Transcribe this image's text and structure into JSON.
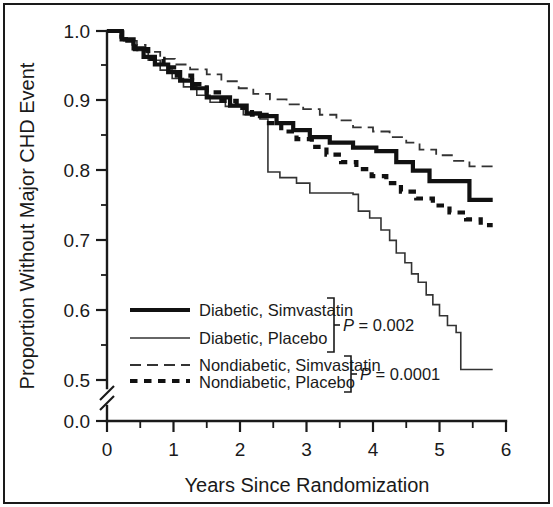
{
  "figure": {
    "background_color": "#ffffff",
    "border_color": "#1a1a1a",
    "ink_color": "#1a1a1a"
  },
  "chart_data": {
    "type": "line",
    "title": "",
    "subtitle": "",
    "xlabel": "Years Since Randomization",
    "ylabel": "Proportion Without Major CHD Event",
    "xlim": [
      0,
      6.2
    ],
    "ylim": [
      0.0,
      1.0
    ],
    "y_axis_break": {
      "present": true,
      "between": [
        0.0,
        0.5
      ],
      "symbol": "double-slash"
    },
    "grid": false,
    "legend_position": "lower-left-inside",
    "x_ticks": [
      0,
      1,
      2,
      3,
      4,
      5,
      6
    ],
    "x_tick_labels": [
      "0",
      "1",
      "2",
      "3",
      "4",
      "5",
      "6"
    ],
    "x_minor_tick_interval": 0.5,
    "y_ticks": [
      0.0,
      0.5,
      0.6,
      0.7,
      0.8,
      0.9,
      1.0
    ],
    "y_tick_labels": [
      "0.0",
      "0.5",
      "0.6",
      "0.7",
      "0.8",
      "0.9",
      "1.0"
    ],
    "y_minor_ticks": [
      0.55,
      0.65,
      0.75,
      0.85,
      0.95
    ],
    "annotations": [
      {
        "text": "P = 0.002",
        "italic_prefix": "P",
        "rest": " = 0.002",
        "groups": [
          "Diabetic, Simvastatin",
          "Diabetic, Placebo"
        ]
      },
      {
        "text": "P = 0.0001",
        "italic_prefix": "P",
        "rest": " = 0.0001",
        "groups": [
          "Nondiabetic, Simvastatin",
          "Nondiabetic, Placebo"
        ]
      }
    ],
    "series": [
      {
        "name": "Diabetic, Simvastatin",
        "style": "thick-solid",
        "color": "#111111",
        "points": [
          [
            0.0,
            1.0
          ],
          [
            0.22,
            1.0
          ],
          [
            0.22,
            0.988
          ],
          [
            0.4,
            0.988
          ],
          [
            0.4,
            0.975
          ],
          [
            0.55,
            0.975
          ],
          [
            0.55,
            0.963
          ],
          [
            0.72,
            0.963
          ],
          [
            0.72,
            0.952
          ],
          [
            0.92,
            0.952
          ],
          [
            0.92,
            0.941
          ],
          [
            1.1,
            0.941
          ],
          [
            1.1,
            0.929
          ],
          [
            1.28,
            0.929
          ],
          [
            1.28,
            0.918
          ],
          [
            1.5,
            0.918
          ],
          [
            1.5,
            0.905
          ],
          [
            1.85,
            0.905
          ],
          [
            1.85,
            0.893
          ],
          [
            2.1,
            0.893
          ],
          [
            2.1,
            0.882
          ],
          [
            2.3,
            0.882
          ],
          [
            2.3,
            0.878
          ],
          [
            2.55,
            0.878
          ],
          [
            2.55,
            0.868
          ],
          [
            2.8,
            0.868
          ],
          [
            2.8,
            0.858
          ],
          [
            3.05,
            0.858
          ],
          [
            3.05,
            0.848
          ],
          [
            3.35,
            0.848
          ],
          [
            3.35,
            0.84
          ],
          [
            3.7,
            0.84
          ],
          [
            3.7,
            0.833
          ],
          [
            4.05,
            0.833
          ],
          [
            4.05,
            0.828
          ],
          [
            4.35,
            0.828
          ],
          [
            4.35,
            0.812
          ],
          [
            4.6,
            0.812
          ],
          [
            4.6,
            0.8
          ],
          [
            4.85,
            0.8
          ],
          [
            4.85,
            0.785
          ],
          [
            5.45,
            0.785
          ],
          [
            5.45,
            0.758
          ],
          [
            5.8,
            0.758
          ]
        ]
      },
      {
        "name": "Diabetic, Placebo",
        "style": "thin-solid",
        "color": "#333333",
        "points": [
          [
            0.0,
            1.0
          ],
          [
            0.25,
            1.0
          ],
          [
            0.25,
            0.986
          ],
          [
            0.45,
            0.986
          ],
          [
            0.45,
            0.972
          ],
          [
            0.62,
            0.972
          ],
          [
            0.62,
            0.958
          ],
          [
            0.8,
            0.958
          ],
          [
            0.8,
            0.944
          ],
          [
            0.98,
            0.944
          ],
          [
            0.98,
            0.932
          ],
          [
            1.15,
            0.932
          ],
          [
            1.15,
            0.92
          ],
          [
            1.35,
            0.92
          ],
          [
            1.35,
            0.908
          ],
          [
            1.55,
            0.908
          ],
          [
            1.55,
            0.898
          ],
          [
            1.78,
            0.898
          ],
          [
            1.78,
            0.892
          ],
          [
            2.05,
            0.892
          ],
          [
            2.05,
            0.88
          ],
          [
            2.3,
            0.88
          ],
          [
            2.3,
            0.874
          ],
          [
            2.42,
            0.874
          ],
          [
            2.42,
            0.798
          ],
          [
            2.6,
            0.798
          ],
          [
            2.6,
            0.79
          ],
          [
            2.85,
            0.79
          ],
          [
            2.85,
            0.782
          ],
          [
            3.05,
            0.782
          ],
          [
            3.05,
            0.768
          ],
          [
            3.7,
            0.768
          ],
          [
            3.7,
            0.766
          ],
          [
            3.78,
            0.766
          ],
          [
            3.78,
            0.742
          ],
          [
            3.95,
            0.742
          ],
          [
            3.95,
            0.732
          ],
          [
            4.12,
            0.732
          ],
          [
            4.12,
            0.715
          ],
          [
            4.25,
            0.715
          ],
          [
            4.25,
            0.7
          ],
          [
            4.35,
            0.7
          ],
          [
            4.35,
            0.682
          ],
          [
            4.48,
            0.682
          ],
          [
            4.48,
            0.668
          ],
          [
            4.58,
            0.668
          ],
          [
            4.58,
            0.652
          ],
          [
            4.68,
            0.652
          ],
          [
            4.68,
            0.64
          ],
          [
            4.8,
            0.64
          ],
          [
            4.8,
            0.622
          ],
          [
            4.9,
            0.622
          ],
          [
            4.9,
            0.608
          ],
          [
            5.0,
            0.608
          ],
          [
            5.0,
            0.592
          ],
          [
            5.12,
            0.592
          ],
          [
            5.12,
            0.578
          ],
          [
            5.25,
            0.578
          ],
          [
            5.25,
            0.568
          ],
          [
            5.32,
            0.568
          ],
          [
            5.32,
            0.515
          ],
          [
            5.8,
            0.515
          ]
        ]
      },
      {
        "name": "Nondiabetic, Simvastatin",
        "style": "long-dashed",
        "color": "#333333",
        "points": [
          [
            0.0,
            1.0
          ],
          [
            0.2,
            1.0
          ],
          [
            0.2,
            0.99
          ],
          [
            0.38,
            0.99
          ],
          [
            0.38,
            0.98
          ],
          [
            0.58,
            0.98
          ],
          [
            0.58,
            0.97
          ],
          [
            0.8,
            0.97
          ],
          [
            0.8,
            0.96
          ],
          [
            1.02,
            0.96
          ],
          [
            1.02,
            0.952
          ],
          [
            1.25,
            0.952
          ],
          [
            1.25,
            0.945
          ],
          [
            1.5,
            0.945
          ],
          [
            1.5,
            0.938
          ],
          [
            1.72,
            0.938
          ],
          [
            1.72,
            0.928
          ],
          [
            1.98,
            0.928
          ],
          [
            1.98,
            0.918
          ],
          [
            2.2,
            0.918
          ],
          [
            2.2,
            0.91
          ],
          [
            2.45,
            0.91
          ],
          [
            2.45,
            0.902
          ],
          [
            2.7,
            0.902
          ],
          [
            2.7,
            0.895
          ],
          [
            2.95,
            0.895
          ],
          [
            2.95,
            0.888
          ],
          [
            3.2,
            0.888
          ],
          [
            3.2,
            0.88
          ],
          [
            3.45,
            0.88
          ],
          [
            3.45,
            0.872
          ],
          [
            3.7,
            0.872
          ],
          [
            3.7,
            0.862
          ],
          [
            4.0,
            0.862
          ],
          [
            4.0,
            0.856
          ],
          [
            4.25,
            0.856
          ],
          [
            4.25,
            0.848
          ],
          [
            4.5,
            0.848
          ],
          [
            4.5,
            0.84
          ],
          [
            4.7,
            0.84
          ],
          [
            4.7,
            0.83
          ],
          [
            4.95,
            0.83
          ],
          [
            4.95,
            0.822
          ],
          [
            5.2,
            0.822
          ],
          [
            5.2,
            0.814
          ],
          [
            5.45,
            0.814
          ],
          [
            5.45,
            0.806
          ],
          [
            5.8,
            0.806
          ]
        ]
      },
      {
        "name": "Nondiabetic, Placebo",
        "style": "thick-dotted",
        "color": "#111111",
        "points": [
          [
            0.0,
            1.0
          ],
          [
            0.22,
            1.0
          ],
          [
            0.22,
            0.986
          ],
          [
            0.42,
            0.986
          ],
          [
            0.42,
            0.974
          ],
          [
            0.62,
            0.974
          ],
          [
            0.62,
            0.96
          ],
          [
            0.85,
            0.96
          ],
          [
            0.85,
            0.948
          ],
          [
            1.05,
            0.948
          ],
          [
            1.05,
            0.936
          ],
          [
            1.28,
            0.936
          ],
          [
            1.28,
            0.924
          ],
          [
            1.5,
            0.924
          ],
          [
            1.5,
            0.912
          ],
          [
            1.72,
            0.912
          ],
          [
            1.72,
            0.9
          ],
          [
            1.95,
            0.9
          ],
          [
            1.95,
            0.89
          ],
          [
            2.18,
            0.89
          ],
          [
            2.18,
            0.88
          ],
          [
            2.4,
            0.88
          ],
          [
            2.4,
            0.868
          ],
          [
            2.62,
            0.868
          ],
          [
            2.62,
            0.856
          ],
          [
            2.85,
            0.856
          ],
          [
            2.85,
            0.845
          ],
          [
            3.08,
            0.845
          ],
          [
            3.08,
            0.834
          ],
          [
            3.3,
            0.834
          ],
          [
            3.3,
            0.823
          ],
          [
            3.52,
            0.823
          ],
          [
            3.52,
            0.812
          ],
          [
            3.75,
            0.812
          ],
          [
            3.75,
            0.802
          ],
          [
            3.98,
            0.802
          ],
          [
            3.98,
            0.792
          ],
          [
            4.2,
            0.792
          ],
          [
            4.2,
            0.782
          ],
          [
            4.42,
            0.782
          ],
          [
            4.42,
            0.77
          ],
          [
            4.65,
            0.77
          ],
          [
            4.65,
            0.76
          ],
          [
            4.9,
            0.76
          ],
          [
            4.9,
            0.75
          ],
          [
            5.15,
            0.75
          ],
          [
            5.15,
            0.74
          ],
          [
            5.4,
            0.74
          ],
          [
            5.4,
            0.73
          ],
          [
            5.62,
            0.73
          ],
          [
            5.62,
            0.722
          ],
          [
            5.8,
            0.722
          ]
        ]
      }
    ]
  },
  "legend": {
    "entries": [
      {
        "label": "Diabetic, Simvastatin",
        "style": "thick-solid"
      },
      {
        "label": "Diabetic, Placebo",
        "style": "thin-solid"
      },
      {
        "label": "Nondiabetic, Simvastatin",
        "style": "long-dashed"
      },
      {
        "label": "Nondiabetic, Placebo",
        "style": "thick-dotted"
      }
    ]
  },
  "axes": {
    "y_title": "Proportion Without Major CHD Event",
    "x_title": "Years Since Randomization",
    "y_labels": [
      "1.0",
      "0.9",
      "0.8",
      "0.7",
      "0.6",
      "0.5",
      "0.0"
    ],
    "x_labels": [
      "0",
      "1",
      "2",
      "3",
      "4",
      "5",
      "6"
    ]
  },
  "pvalues": {
    "top": {
      "symbol": "P",
      "rest": " = 0.002"
    },
    "bottom": {
      "symbol": "P",
      "rest": " = 0.0001"
    }
  }
}
